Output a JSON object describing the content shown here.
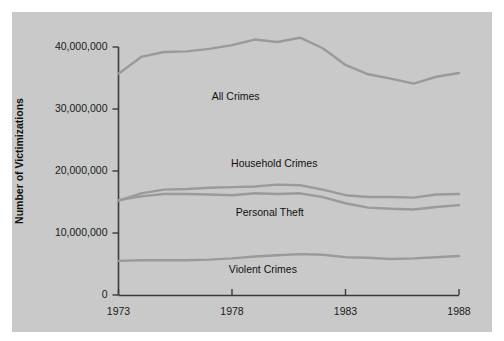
{
  "chart_data": {
    "type": "line",
    "title": "",
    "xlabel": "",
    "ylabel": "Number of Victimizations",
    "xlim": [
      1973,
      1988
    ],
    "ylim": [
      0,
      42000000
    ],
    "grid": false,
    "legend_position": "inline-annotations",
    "x": [
      1973,
      1974,
      1975,
      1976,
      1977,
      1978,
      1979,
      1980,
      1981,
      1982,
      1983,
      1984,
      1985,
      1986,
      1987,
      1988
    ],
    "xticks": [
      "1973",
      "1978",
      "1983",
      "1988"
    ],
    "yticks": [
      "0",
      "10,000,000",
      "20,000,000",
      "30,000,000",
      "40,000,000"
    ],
    "ytick_values": [
      0,
      10000000,
      20000000,
      30000000,
      40000000
    ],
    "series": [
      {
        "name": "All Crimes",
        "color": "#9a9a9a",
        "label_x": 1977.5,
        "label_y": 32000000,
        "values": [
          35700000,
          38400000,
          39200000,
          39300000,
          39700000,
          40300000,
          41200000,
          40800000,
          41500000,
          39800000,
          37100000,
          35600000,
          34900000,
          34100000,
          35200000,
          35800000
        ]
      },
      {
        "name": "Household Crimes",
        "color": "#9a9a9a",
        "label_x": 1979.2,
        "label_y": 21200000,
        "values": [
          15200000,
          16400000,
          17000000,
          17100000,
          17300000,
          17400000,
          17500000,
          17800000,
          17700000,
          17000000,
          16100000,
          15800000,
          15800000,
          15700000,
          16200000,
          16300000
        ]
      },
      {
        "name": "Personal Theft",
        "color": "#9a9a9a",
        "label_x": 1979.0,
        "label_y": 13200000,
        "values": [
          15300000,
          15900000,
          16300000,
          16300000,
          16200000,
          16100000,
          16400000,
          16300000,
          16400000,
          15800000,
          14800000,
          14100000,
          13900000,
          13800000,
          14200000,
          14500000
        ]
      },
      {
        "name": "Violent Crimes",
        "color": "#9a9a9a",
        "label_x": 1978.7,
        "label_y": 4100000,
        "values": [
          5500000,
          5600000,
          5600000,
          5600000,
          5700000,
          5900000,
          6200000,
          6400000,
          6600000,
          6500000,
          6100000,
          6000000,
          5800000,
          5900000,
          6100000,
          6300000
        ]
      }
    ]
  },
  "axes": {
    "y_axis_title": "Number of Victimizations"
  },
  "colors": {
    "panel_background": "#c9c9c9",
    "figure_background": "#ffffff",
    "axis": "#3a3a3a",
    "line": "#9a9a9a",
    "text": "#111111"
  }
}
